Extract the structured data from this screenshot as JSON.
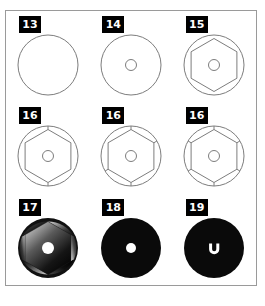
{
  "figure": {
    "title": "",
    "colors": {
      "frame_border": "#9a9a9a",
      "background": "#ffffff",
      "wireframe_stroke": "#7d7d7d",
      "label_background": "#000000",
      "label_text": "#ffffff",
      "solid_fill": "#0a0a0a",
      "hole_fill": "#ffffff"
    },
    "layout": {
      "rows": 3,
      "columns": 3
    },
    "panels": [
      {
        "label": "13",
        "name": "panel-13",
        "description": "plain circle outline",
        "style": "wireframe",
        "has_hub": false,
        "has_hexagon": false,
        "spokes": 0
      },
      {
        "label": "14",
        "name": "panel-14",
        "description": "circle outline with small centre hub circle",
        "style": "wireframe",
        "has_hub": true,
        "has_hexagon": false,
        "spokes": 0
      },
      {
        "label": "15",
        "name": "panel-15",
        "description": "circle with inscribed hexagon and centre hub",
        "style": "wireframe",
        "has_hub": true,
        "has_hexagon": true,
        "spokes": 0
      },
      {
        "label": "16",
        "name": "panel-16-a",
        "description": "hexagon in circle with two radial spokes (top and bottom)",
        "style": "wireframe",
        "has_hub": true,
        "has_hexagon": true,
        "spokes": 2
      },
      {
        "label": "16",
        "name": "panel-16-b",
        "description": "hexagon in circle with four radial spokes",
        "style": "wireframe",
        "has_hub": true,
        "has_hexagon": true,
        "spokes": 4
      },
      {
        "label": "16",
        "name": "panel-16-c",
        "description": "hexagon in circle with all six radial spokes",
        "style": "wireframe",
        "has_hub": true,
        "has_hexagon": true,
        "spokes": 6
      },
      {
        "label": "17",
        "name": "panel-17",
        "description": "shaded faceted ball render with white centre hole",
        "style": "shaded",
        "has_hub": true,
        "has_hexagon": true,
        "spokes": 6
      },
      {
        "label": "18",
        "name": "panel-18",
        "description": "solid black disc with small white centre hole",
        "style": "solid",
        "has_hub": true,
        "has_hexagon": false,
        "spokes": 0
      },
      {
        "label": "19",
        "name": "panel-19",
        "description": "solid black disc with white horseshoe mark at centre",
        "style": "solid",
        "has_hub": false,
        "has_hexagon": false,
        "spokes": 0
      }
    ]
  }
}
